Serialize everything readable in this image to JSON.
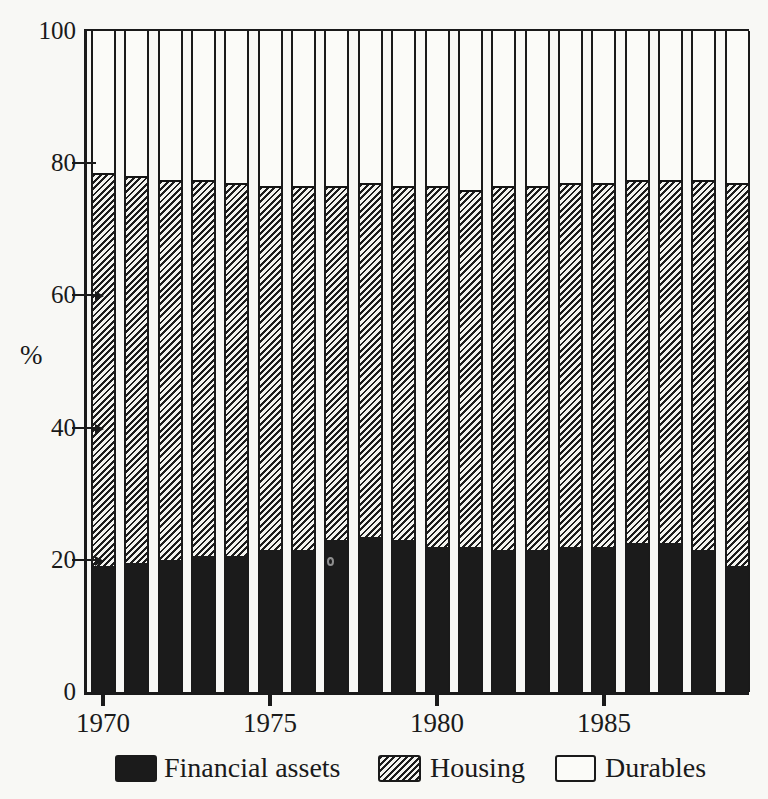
{
  "chart_data": {
    "type": "bar",
    "stacked": true,
    "title": "",
    "ylabel": "%",
    "xlabel": "",
    "ylim": [
      0,
      100
    ],
    "grid": false,
    "legend_position": "bottom",
    "y_tick_labels": [
      "100",
      "80",
      "60",
      "40",
      "20",
      "0"
    ],
    "x_tick_labels": [
      "1970",
      "1975",
      "1980",
      "1985"
    ],
    "categories": [
      1970,
      1971,
      1972,
      1973,
      1974,
      1975,
      1976,
      1977,
      1978,
      1979,
      1980,
      1981,
      1982,
      1983,
      1984,
      1985,
      1986,
      1987,
      1988,
      1989
    ],
    "series": [
      {
        "name": "Financial assets",
        "swatch_style": "solid-black",
        "values": [
          19,
          19.5,
          20,
          20.5,
          20.5,
          21.5,
          21.5,
          23,
          23.5,
          23,
          22,
          22,
          21.5,
          21.5,
          22,
          22,
          22.5,
          22.5,
          21.5,
          19
        ]
      },
      {
        "name": "Housing",
        "swatch_style": "diagonal-hatch",
        "values": [
          59.5,
          58.5,
          57.5,
          57,
          56.5,
          55,
          55,
          53.5,
          53.5,
          53.5,
          54.5,
          54,
          55,
          55,
          55,
          55,
          55,
          55,
          56,
          58
        ]
      },
      {
        "name": "Durables",
        "swatch_style": "white",
        "values": [
          21.5,
          22,
          22.5,
          22.5,
          23,
          23.5,
          23.5,
          23.5,
          23,
          23.5,
          23.5,
          24,
          23.5,
          23.5,
          23,
          23,
          22.5,
          22.5,
          22.5,
          23
        ]
      }
    ],
    "colors": {
      "ink": "#1a1a1a",
      "paper": "#f8f8f5",
      "bar_white": "#fbfbf8",
      "bar_black": "#1b1b1b"
    }
  }
}
